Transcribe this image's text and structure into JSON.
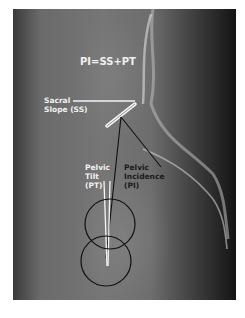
{
  "figure": {
    "formula": "PI=SS+PT",
    "labels": {
      "sacral_slope": [
        "Sacral",
        "Slope (SS)"
      ],
      "pelvic_tilt": [
        "Pelvic",
        "Tilt",
        "(PT)"
      ],
      "pelvic_incidence": [
        "Pelvic",
        "Incidence",
        "(PI)"
      ]
    },
    "colors": {
      "annotation_white": "#f2f2f2",
      "annotation_black": "#1a1a1a",
      "background": "#ffffff"
    }
  }
}
